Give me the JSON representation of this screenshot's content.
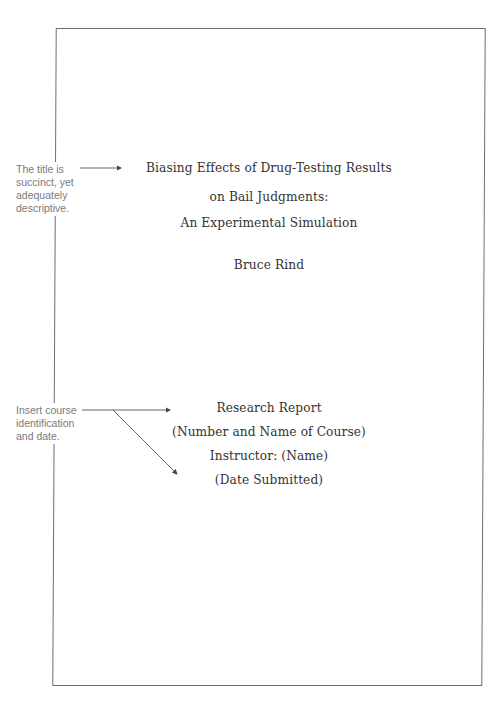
{
  "title_page": {
    "title_lines": [
      "Biasing Effects of Drug-Testing Results",
      "on Bail Judgments:",
      "An Experimental Simulation"
    ],
    "author": "Bruce Rind",
    "course_block": [
      "Research Report",
      "(Number and Name of Course)",
      "Instructor: (Name)",
      "(Date Submitted)"
    ]
  },
  "annotations": [
    {
      "lines": [
        "The title is",
        "succinct, yet",
        "adequately",
        "descriptive."
      ]
    },
    {
      "lines": [
        "Insert course",
        "identification",
        "and date."
      ]
    }
  ],
  "colors": {
    "border": "#6e6e6e",
    "text": "#333333",
    "annotation": "#7a7a7a"
  }
}
